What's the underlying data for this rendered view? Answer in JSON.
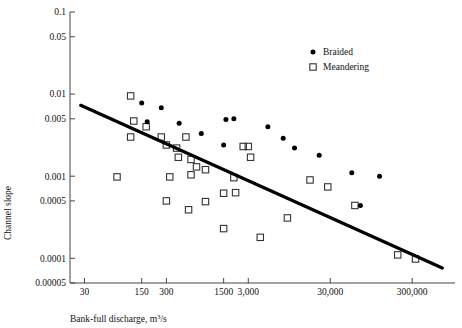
{
  "chart_data": {
    "type": "scatter",
    "title": "",
    "xlabel": "Bank-full discharge, m3/s",
    "xlabel_base": "Bank-full discharge, m",
    "xlabel_exponent": "3",
    "xlabel_suffix": "/s",
    "ylabel": "Channel slope",
    "xscale": "log",
    "yscale": "log",
    "xlim": [
      20,
      1000000
    ],
    "ylim": [
      5e-05,
      0.1
    ],
    "grid": false,
    "xticks": [
      30,
      150,
      300,
      1500,
      3000,
      30000,
      300000
    ],
    "xticklabels": [
      "30",
      "150",
      "300",
      "1500",
      "3,000",
      "30,000",
      "300,000"
    ],
    "yticks": [
      0.1,
      0.05,
      0.01,
      0.005,
      0.001,
      0.0005,
      0.0001,
      5e-05
    ],
    "yticklabels": [
      "0.1",
      "0.05",
      "0.01",
      "0.005",
      "0.001",
      "0.0005",
      "0.0001",
      "0.00005"
    ],
    "legend_position": "top-right",
    "series": [
      {
        "name": "Braided",
        "marker": "filled-circle",
        "color": "#000000",
        "points": [
          [
            150,
            0.0078
          ],
          [
            260,
            0.0068
          ],
          [
            175,
            0.0046
          ],
          [
            430,
            0.0044
          ],
          [
            800,
            0.0033
          ],
          [
            2000,
            0.005
          ],
          [
            1600,
            0.0049
          ],
          [
            1500,
            0.0024
          ],
          [
            5200,
            0.004
          ],
          [
            8000,
            0.0029
          ],
          [
            11000,
            0.0022
          ],
          [
            22000,
            0.0018
          ],
          [
            55000,
            0.0011
          ],
          [
            70000,
            0.00044
          ],
          [
            120000,
            0.001
          ]
        ]
      },
      {
        "name": "Meandering",
        "marker": "open-square",
        "color": "#333333",
        "points": [
          [
            110,
            0.0095
          ],
          [
            120,
            0.0047
          ],
          [
            170,
            0.004
          ],
          [
            110,
            0.003
          ],
          [
            260,
            0.003
          ],
          [
            300,
            0.0024
          ],
          [
            400,
            0.0022
          ],
          [
            420,
            0.0017
          ],
          [
            520,
            0.003
          ],
          [
            600,
            0.0016
          ],
          [
            700,
            0.0013
          ],
          [
            900,
            0.0012
          ],
          [
            2600,
            0.0023
          ],
          [
            3000,
            0.0023
          ],
          [
            3200,
            0.0017
          ],
          [
            75,
            0.00098
          ],
          [
            330,
            0.00098
          ],
          [
            600,
            0.00104
          ],
          [
            300,
            0.0005
          ],
          [
            560,
            0.00039
          ],
          [
            900,
            0.00049
          ],
          [
            1500,
            0.00062
          ],
          [
            2000,
            0.00096
          ],
          [
            2100,
            0.00063
          ],
          [
            1500,
            0.00023
          ],
          [
            4200,
            0.00018
          ],
          [
            9000,
            0.00031
          ],
          [
            17000,
            0.0009
          ],
          [
            28000,
            0.00074
          ],
          [
            60000,
            0.00044
          ],
          [
            200000,
            0.00011
          ],
          [
            330000,
            9.8e-05
          ]
        ]
      }
    ],
    "trend_line": {
      "label": "regression",
      "x_start": 27,
      "y_start": 0.0073,
      "x_end": 700000,
      "y_end": 7.6e-05
    }
  },
  "legend": {
    "items": [
      {
        "label": "Braided",
        "marker": "filled-circle"
      },
      {
        "label": "Meandering",
        "marker": "open-square"
      }
    ]
  }
}
